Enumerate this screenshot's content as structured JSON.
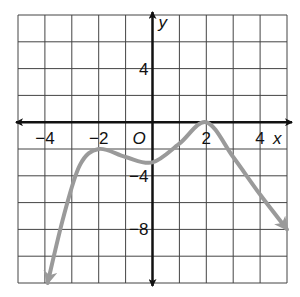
{
  "chart_data": {
    "type": "line",
    "title": "",
    "xlabel": "x",
    "ylabel": "y",
    "origin_label": "O",
    "xlim": [
      -5,
      5
    ],
    "ylim": [
      -12,
      8
    ],
    "grid": true,
    "grid_step": {
      "x": 1,
      "y": 2
    },
    "x_tick_labels": [
      "−4",
      "−2",
      "2",
      "4"
    ],
    "x_tick_values": [
      -4,
      -2,
      2,
      4
    ],
    "y_tick_labels": [
      "4",
      "−4",
      "−8"
    ],
    "y_tick_values": [
      4,
      -4,
      -8
    ],
    "series": [
      {
        "name": "polynomial curve",
        "color": "#999999",
        "points": [
          {
            "x": -3.9,
            "y": -12
          },
          {
            "x": -3.3,
            "y": -7
          },
          {
            "x": -2.7,
            "y": -3.2
          },
          {
            "x": -2,
            "y": -2
          },
          {
            "x": -1,
            "y": -2.6
          },
          {
            "x": 0,
            "y": -3
          },
          {
            "x": 1,
            "y": -1.6
          },
          {
            "x": 2,
            "y": 0
          },
          {
            "x": 3,
            "y": -2.6
          },
          {
            "x": 4,
            "y": -5.4
          },
          {
            "x": 5,
            "y": -8
          }
        ],
        "end_arrows": true
      }
    ],
    "key_points": [
      {
        "label": "local max",
        "x": -2,
        "y": -2
      },
      {
        "label": "local min",
        "x": 0,
        "y": -3
      },
      {
        "label": "local max",
        "x": 2,
        "y": 0
      }
    ]
  },
  "colors": {
    "grid": "#444444",
    "axis": "#111111",
    "curve": "#9a9a9a"
  }
}
